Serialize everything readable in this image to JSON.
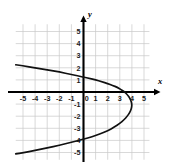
{
  "chart_data": {
    "type": "line",
    "title": "",
    "subtitle": "",
    "xlabel": "x",
    "ylabel": "y",
    "grid": true,
    "legend": null,
    "xlim": [
      -5.7,
      5.5
    ],
    "ylim": [
      -5.7,
      5.7
    ],
    "x_ticks": [
      -5,
      -4,
      -3,
      -2,
      -1,
      0,
      1,
      2,
      3,
      4,
      5
    ],
    "y_ticks": [
      5,
      4,
      3,
      2,
      1,
      0,
      -1,
      -2,
      -3,
      -4,
      -5
    ],
    "x_tick_labels": [
      "-5",
      "-4",
      "-3",
      "-2",
      "-1",
      "0",
      "1",
      "2",
      "3",
      "4",
      "5"
    ],
    "y_tick_labels": [
      "5",
      "4",
      "3",
      "2",
      "1",
      "0",
      "-1",
      "-2",
      "-3",
      "-4",
      "-5"
    ],
    "series": [
      {
        "name": "sideways-parabola",
        "description": "Leftward-opening parabola, vertex near (4, -1)",
        "vertex": [
          4,
          -1
        ],
        "x_intercept": 3,
        "y_intercepts": [
          1.2,
          -3.1
        ],
        "points": [
          [
            -5.6,
            2.25
          ],
          [
            -5.0,
            2.16
          ],
          [
            -4.0,
            2.0
          ],
          [
            -3.0,
            1.83
          ],
          [
            -2.0,
            1.65
          ],
          [
            -1.0,
            1.45
          ],
          [
            0.0,
            1.24
          ],
          [
            0.5,
            1.12
          ],
          [
            1.0,
            1.0
          ],
          [
            1.5,
            0.85
          ],
          [
            2.0,
            0.7
          ],
          [
            2.4,
            0.55
          ],
          [
            2.8,
            0.38
          ],
          [
            3.1,
            0.2
          ],
          [
            3.4,
            0.0
          ],
          [
            3.65,
            -0.25
          ],
          [
            3.85,
            -0.55
          ],
          [
            3.97,
            -0.85
          ],
          [
            4.0,
            -1.1
          ],
          [
            3.95,
            -1.4
          ],
          [
            3.82,
            -1.7
          ],
          [
            3.62,
            -2.0
          ],
          [
            3.35,
            -2.3
          ],
          [
            3.0,
            -2.6
          ],
          [
            2.55,
            -2.9
          ],
          [
            2.0,
            -3.2
          ],
          [
            1.4,
            -3.45
          ],
          [
            0.7,
            -3.7
          ],
          [
            0.0,
            -3.9
          ],
          [
            -1.0,
            -4.15
          ],
          [
            -2.0,
            -4.4
          ],
          [
            -3.0,
            -4.62
          ],
          [
            -4.0,
            -4.83
          ],
          [
            -5.0,
            -5.02
          ],
          [
            -5.6,
            -5.12
          ]
        ]
      }
    ],
    "colors": {
      "curve": "#111111",
      "axis": "#000000",
      "grid": "#c9c9c9",
      "background": "#ffffff",
      "tick_text": "#1a1a1a"
    }
  },
  "axes": {
    "x_axis_label": "x",
    "y_axis_label": "y"
  }
}
